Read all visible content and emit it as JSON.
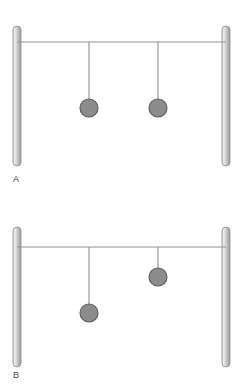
{
  "figure": {
    "width": 247,
    "height": 391,
    "background_color": "#ffffff"
  },
  "style": {
    "post_fill_light": "#e3e3e3",
    "post_fill_mid": "#b9b9b9",
    "post_fill_dark": "#9a9a9a",
    "post_stroke": "#8a8a8a",
    "beam_color": "#8f8f8f",
    "string_color": "#8f8f8f",
    "bob_fill": "#8c8c8c",
    "bob_stroke": "#5a5a5a",
    "label_color": "#4a4a4a"
  },
  "panels": [
    {
      "id": "panel-a",
      "label": "A",
      "frame": {
        "left_post": {
          "x": 13,
          "y_top": 26,
          "y_bottom": 166,
          "width": 8
        },
        "right_post": {
          "x": 222,
          "y_top": 26,
          "y_bottom": 166,
          "width": 8
        },
        "beam": {
          "y": 42,
          "x_start": 17,
          "x_end": 226,
          "thickness": 1
        }
      },
      "pendulums": [
        {
          "name": "left-pendulum",
          "pivot_x": 89,
          "pivot_y": 42,
          "string_length": 57,
          "bob_center_x": 89,
          "bob_center_y": 108,
          "bob_radius": 9
        },
        {
          "name": "right-pendulum",
          "pivot_x": 158,
          "pivot_y": 42,
          "string_length": 57,
          "bob_center_x": 158,
          "bob_center_y": 108,
          "bob_radius": 9
        }
      ]
    },
    {
      "id": "panel-b",
      "label": "B",
      "frame": {
        "left_post": {
          "x": 13,
          "y_top": 31,
          "y_bottom": 171,
          "width": 8
        },
        "right_post": {
          "x": 222,
          "y_top": 31,
          "y_bottom": 171,
          "width": 8
        },
        "beam": {
          "y": 51,
          "x_start": 17,
          "x_end": 226,
          "thickness": 1
        }
      },
      "pendulums": [
        {
          "name": "left-pendulum",
          "pivot_x": 89,
          "pivot_y": 51,
          "string_length": 57,
          "bob_center_x": 89,
          "bob_center_y": 117,
          "bob_radius": 9
        },
        {
          "name": "right-pendulum",
          "pivot_x": 158,
          "pivot_y": 51,
          "string_length": 21,
          "bob_center_x": 158,
          "bob_center_y": 81,
          "bob_radius": 9
        }
      ]
    }
  ]
}
